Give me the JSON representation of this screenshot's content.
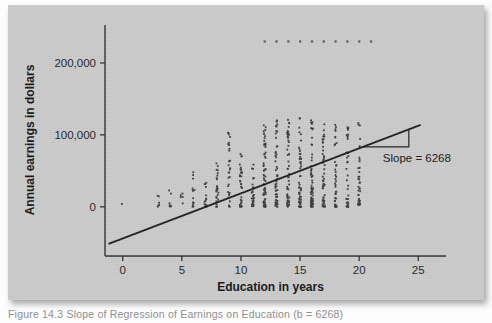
{
  "figure": {
    "caption": "Figure 14.3   Slope of Regression of Earnings on Education   (b = 6268)"
  },
  "chart_data": {
    "type": "scatter",
    "title": "",
    "xlabel": "Education in years",
    "ylabel": "Annual earnings in dollars",
    "xlim": [
      -1.5,
      26.5
    ],
    "ylim": [
      -60000,
      250000
    ],
    "xticks": [
      0,
      5,
      10,
      15,
      20,
      25
    ],
    "xticklabels": [
      "0",
      "5",
      "10",
      "15",
      "20",
      "25"
    ],
    "yticks": [
      0,
      100000,
      200000
    ],
    "yticklabels": [
      "0",
      "100,000",
      "200,000"
    ],
    "grid": false,
    "legend": null,
    "marker": "square",
    "marker_color": "#3a3a3a",
    "regression": {
      "slope": 6268,
      "intercept": -44000,
      "x_start": -1.2,
      "x_end": 25.2,
      "line_color": "#1a1a1a",
      "annotation": "Slope = 6268",
      "annotation_x": 22.0,
      "annotation_y": 62000
    },
    "topcode_value": 230000,
    "topcode_x": [
      12,
      13,
      14,
      15,
      16,
      17,
      18,
      19,
      20,
      21
    ],
    "series": [
      {
        "name": "Observations",
        "columns": [
          {
            "x": 0,
            "count": 1,
            "y_min": 4000,
            "y_max": 4000
          },
          {
            "x": 3,
            "count": 6,
            "y_min": 0,
            "y_max": 21000
          },
          {
            "x": 4,
            "count": 7,
            "y_min": 0,
            "y_max": 24000
          },
          {
            "x": 5,
            "count": 5,
            "y_min": 0,
            "y_max": 19000
          },
          {
            "x": 6,
            "count": 14,
            "y_min": 0,
            "y_max": 61000
          },
          {
            "x": 7,
            "count": 17,
            "y_min": 0,
            "y_max": 35000
          },
          {
            "x": 8,
            "count": 26,
            "y_min": 0,
            "y_max": 61000
          },
          {
            "x": 9,
            "count": 30,
            "y_min": 0,
            "y_max": 108000
          },
          {
            "x": 10,
            "count": 34,
            "y_min": 0,
            "y_max": 80000
          },
          {
            "x": 11,
            "count": 30,
            "y_min": 0,
            "y_max": 62000
          },
          {
            "x": 12,
            "count": 64,
            "y_min": 0,
            "y_max": 127000
          },
          {
            "x": 13,
            "count": 55,
            "y_min": 0,
            "y_max": 125000
          },
          {
            "x": 14,
            "count": 58,
            "y_min": 0,
            "y_max": 122000
          },
          {
            "x": 15,
            "count": 52,
            "y_min": 0,
            "y_max": 124000
          },
          {
            "x": 16,
            "count": 66,
            "y_min": 0,
            "y_max": 126000
          },
          {
            "x": 17,
            "count": 52,
            "y_min": 0,
            "y_max": 121000
          },
          {
            "x": 18,
            "count": 42,
            "y_min": 0,
            "y_max": 118000
          },
          {
            "x": 19,
            "count": 36,
            "y_min": 0,
            "y_max": 115000
          },
          {
            "x": 20,
            "count": 40,
            "y_min": 2000,
            "y_max": 126000
          }
        ]
      }
    ]
  }
}
